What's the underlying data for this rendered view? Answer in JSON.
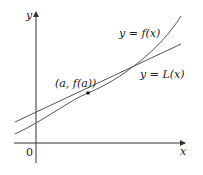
{
  "figure": {
    "axes": {
      "x_label": "x",
      "y_label": "y",
      "origin_label": "0"
    },
    "curve_label": "y = f(x)",
    "tangent_label": "y = L(x)",
    "point_label": "(a, f(a))",
    "colors": {
      "axis": "#333333",
      "curve": "#555555",
      "point": "#111111"
    }
  }
}
